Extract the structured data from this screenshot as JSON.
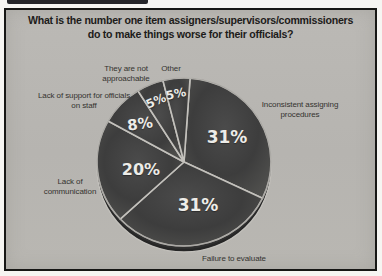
{
  "chart_data": {
    "type": "pie",
    "title": "What is the number one item assigners/supervisors/commissioners do to make things worse for their officials?",
    "title_lines": [
      "What is the number one item assigners/supervisors/commissioners",
      "do to make things worse for their officials?"
    ],
    "start_angle_deg": 4,
    "legend": "none",
    "slices": [
      {
        "label": "Inconsistent assigning procedures",
        "value": 31,
        "pct_text": "31%"
      },
      {
        "label": "Failure to evaluate",
        "value": 31,
        "pct_text": "31%"
      },
      {
        "label": "Lack of communication",
        "value": 20,
        "pct_text": "20%"
      },
      {
        "label": "Lack of support for officials on staff",
        "value": 8,
        "pct_text": "8%"
      },
      {
        "label": "They are not approachable",
        "value": 5,
        "pct_text": "5%"
      },
      {
        "label": "Other",
        "value": 5,
        "pct_text": "5%"
      }
    ],
    "colors": {
      "background": "#b7b5b1",
      "page_margin": "#f6f5f2",
      "frame_border": "#171715",
      "pie_fill_center": "#4b4b4b",
      "pie_fill_mid": "#3d3d3d",
      "pie_fill_edge": "#4e4e4c",
      "rim": "#262626",
      "rim_side": "#2f2f2f",
      "divider": "#c3c1bc",
      "outer_ring": "#96948f",
      "pct_text": "#edece8",
      "label_text": "#34332f",
      "title_text": "#1d1c1a"
    }
  }
}
